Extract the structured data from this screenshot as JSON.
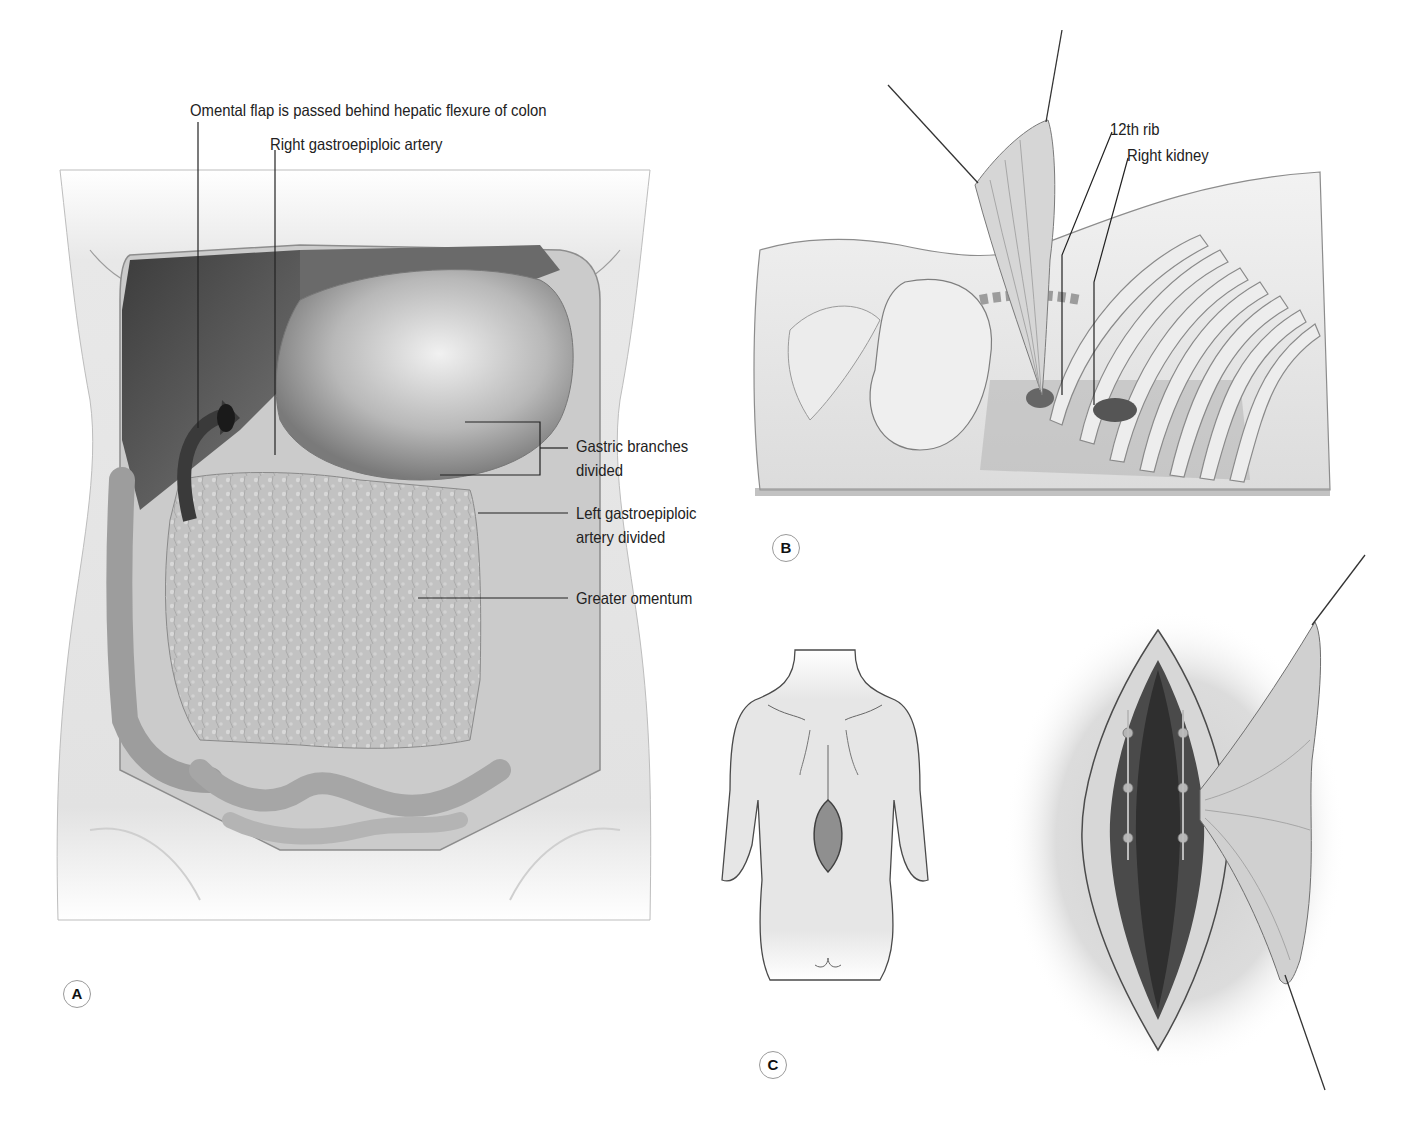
{
  "figure": {
    "panels": [
      {
        "id": "A",
        "badge": "A",
        "description": "Anterior abdominal view: omental flap mobilized on right gastroepiploic artery",
        "labels": {
          "omental_flap": "Omental flap is passed behind hepatic flexure of colon",
          "right_gastroepiploic": "Right gastroepiploic artery",
          "gastric_branches_1": "Gastric branches",
          "gastric_branches_2": "divided",
          "left_gastroepiploic_1": "Left gastroepiploic",
          "left_gastroepiploic_2": "artery divided",
          "greater_omentum": "Greater omentum"
        }
      },
      {
        "id": "B",
        "badge": "B",
        "description": "Lateral view: omentum brought out through flank near 12th rib",
        "labels": {
          "twelfth_rib": "12th rib",
          "right_kidney": "Right kidney"
        }
      },
      {
        "id": "C",
        "badge": "C",
        "description": "Posterior view of lumbar incision and omentum spread over exposed spine",
        "labels": {}
      }
    ],
    "colors": {
      "ink": "#222222",
      "skin": "#e6e6e6",
      "skin_shadow": "#cfcfcf",
      "organ_dark": "#5a5a5a",
      "organ_mid": "#8a8a8a",
      "omentum": "#bdbdbd",
      "incision": "#7a7a7a"
    }
  }
}
